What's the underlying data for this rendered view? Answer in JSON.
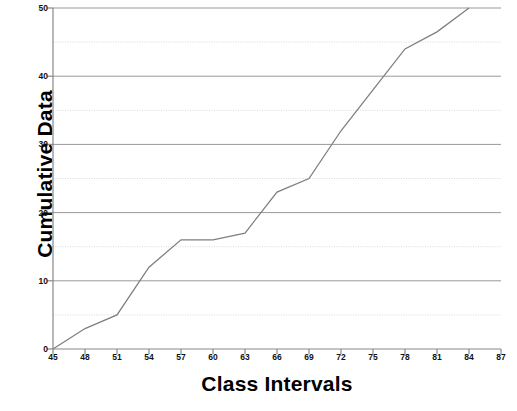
{
  "chart_data": {
    "type": "line",
    "title": "",
    "subtitle": "",
    "xlabel": "Class Intervals",
    "ylabel": "Cumulative Data",
    "xlim": [
      45,
      87
    ],
    "ylim": [
      0,
      50
    ],
    "x_ticks": [
      45,
      48,
      51,
      54,
      57,
      60,
      63,
      66,
      69,
      72,
      75,
      78,
      81,
      84,
      87
    ],
    "y_ticks": [
      0,
      10,
      20,
      30,
      40,
      50
    ],
    "y_minor_ticks": [
      5,
      15,
      25,
      35,
      45
    ],
    "grid": "horizontal major solid, horizontal minor dotted",
    "legend": "none",
    "series": [
      {
        "name": "Cumulative Data",
        "color": "#808080",
        "x": [
          45,
          48,
          51,
          54,
          57,
          60,
          63,
          66,
          69,
          72,
          75,
          78,
          81,
          84
        ],
        "values": [
          0,
          3,
          5,
          12,
          16,
          16,
          17,
          23,
          25,
          32,
          38,
          44,
          46.5,
          50
        ]
      }
    ]
  },
  "axis": {
    "x_title": "Class Intervals",
    "y_title": "Cumulative Data",
    "x_tick_labels": [
      "45",
      "48",
      "51",
      "54",
      "57",
      "60",
      "63",
      "66",
      "69",
      "72",
      "75",
      "78",
      "81",
      "84",
      "87"
    ],
    "y_tick_labels": [
      "0",
      "10",
      "20",
      "30",
      "40",
      "50"
    ]
  },
  "colors": {
    "series_line": "#808080",
    "major_grid": "#999999",
    "minor_grid": "#d8d8d8",
    "axis": "#888888",
    "text": "#000000",
    "background": "#ffffff"
  }
}
